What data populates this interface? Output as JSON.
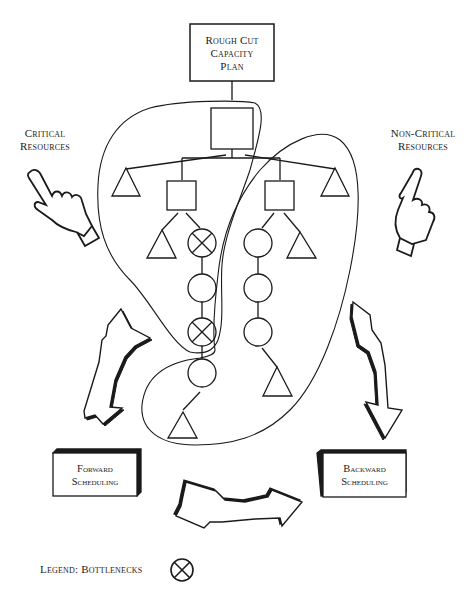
{
  "top_box": {
    "line1": "Rough Cut",
    "line2": "Capacity",
    "line3": "Plan"
  },
  "left_label": {
    "line1": "Critical",
    "line2": "Resources"
  },
  "right_label": {
    "line1": "Non-Critical",
    "line2": "Resources"
  },
  "forward_box": {
    "line1": "Forward",
    "line2": "Scheduling"
  },
  "backward_box": {
    "line1": "Backward",
    "line2": "Scheduling"
  },
  "legend": {
    "text": "Legend: Bottlenecks",
    "icon": "bottleneck-x-circle-icon"
  },
  "colors": {
    "ink": "#1a1a1a",
    "background": "#ffffff"
  }
}
